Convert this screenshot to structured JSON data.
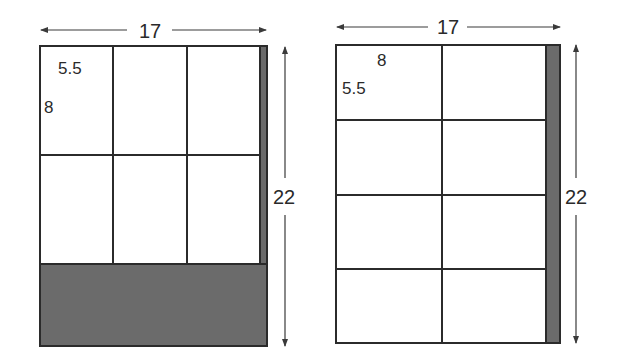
{
  "diagrams": [
    {
      "name": "portrait-layout",
      "width_label": "17",
      "height_label": "22",
      "cell_width_label": "5.5",
      "cell_height_label": "8",
      "columns": 3,
      "rows": 2,
      "waste": "bottom band and right strip"
    },
    {
      "name": "landscape-layout",
      "width_label": "17",
      "height_label": "22",
      "cell_width_label": "8",
      "cell_height_label": "5.5",
      "columns": 2,
      "rows": 4,
      "waste": "right strip"
    }
  ],
  "colors": {
    "line": "#2b2b2b",
    "waste_fill": "#6b6b6b",
    "paper": "#ffffff"
  }
}
